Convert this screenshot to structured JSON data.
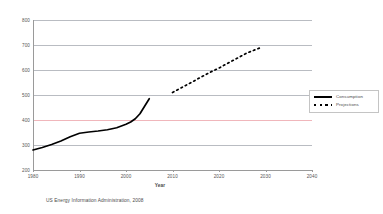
{
  "chart_data": {
    "type": "line",
    "title": "",
    "xlabel": "Year",
    "ylabel": "",
    "xlim": [
      1980,
      2040
    ],
    "ylim": [
      200,
      800
    ],
    "xticks": [
      1980,
      1990,
      2000,
      2010,
      2020,
      2030,
      2040
    ],
    "yticks": [
      200,
      300,
      400,
      500,
      600,
      700,
      800
    ],
    "grid": true,
    "grid_color": "#b9bcc2",
    "highlight_gridline": {
      "value": 400,
      "color": "#f0b6bb"
    },
    "legend_position": "right",
    "series": [
      {
        "name": "Consumption",
        "style": "solid",
        "color": "#000000",
        "x": [
          1980,
          1982,
          1984,
          1986,
          1988,
          1990,
          1992,
          1994,
          1996,
          1998,
          2000,
          2001,
          2002,
          2003,
          2004,
          2005
        ],
        "values": [
          280,
          290,
          302,
          316,
          333,
          347,
          352,
          356,
          361,
          369,
          383,
          392,
          405,
          425,
          455,
          485
        ]
      },
      {
        "name": "Projections",
        "style": "dotted",
        "color": "#000000",
        "x": [
          2010,
          2012,
          2014,
          2016,
          2018,
          2020,
          2022,
          2024,
          2026,
          2029
        ],
        "values": [
          510,
          530,
          550,
          570,
          590,
          608,
          628,
          648,
          668,
          690
        ]
      }
    ],
    "annotations": {
      "source": "US Energy Information Administration, 2008"
    }
  },
  "legend": {
    "entries": [
      {
        "label": "Consumption",
        "style": "solid"
      },
      {
        "label": "Projections",
        "style": "dotted"
      }
    ]
  },
  "labels": {
    "xaxis_title": "Year",
    "source_caption": "US Energy Information Administration, 2008"
  }
}
